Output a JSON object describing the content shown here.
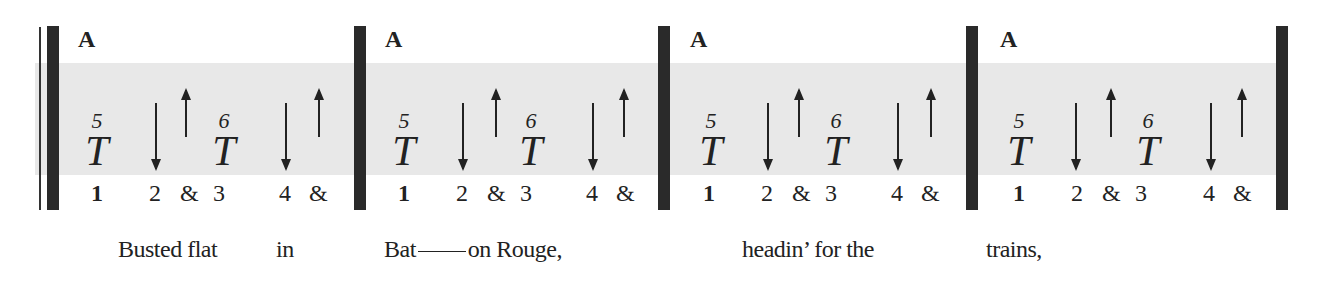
{
  "measures": [
    {
      "chord": "A",
      "tab": [
        {
          "num": "5",
          "letter": "T"
        },
        {
          "num": "6",
          "letter": "T"
        }
      ],
      "strums": [
        "down",
        "up",
        "down",
        "up"
      ],
      "beats": [
        "1",
        "2",
        "&",
        "3",
        "4",
        "&"
      ]
    },
    {
      "chord": "A",
      "tab": [
        {
          "num": "5",
          "letter": "T"
        },
        {
          "num": "6",
          "letter": "T"
        }
      ],
      "strums": [
        "down",
        "up",
        "down",
        "up"
      ],
      "beats": [
        "1",
        "2",
        "&",
        "3",
        "4",
        "&"
      ]
    },
    {
      "chord": "A",
      "tab": [
        {
          "num": "5",
          "letter": "T"
        },
        {
          "num": "6",
          "letter": "T"
        }
      ],
      "strums": [
        "down",
        "up",
        "down",
        "up"
      ],
      "beats": [
        "1",
        "2",
        "&",
        "3",
        "4",
        "&"
      ]
    },
    {
      "chord": "A",
      "tab": [
        {
          "num": "5",
          "letter": "T"
        },
        {
          "num": "6",
          "letter": "T"
        }
      ],
      "strums": [
        "down",
        "up",
        "down",
        "up"
      ],
      "beats": [
        "1",
        "2",
        "&",
        "3",
        "4",
        "&"
      ]
    }
  ],
  "lyrics": {
    "l1": "Busted flat",
    "l2": "in",
    "l3a": "Bat",
    "l3b": "on Rouge,",
    "l4": "headin’ for  the",
    "l5": "trains,"
  },
  "colors": {
    "band": "#e8e8e8",
    "bar": "#2a2a2a"
  }
}
